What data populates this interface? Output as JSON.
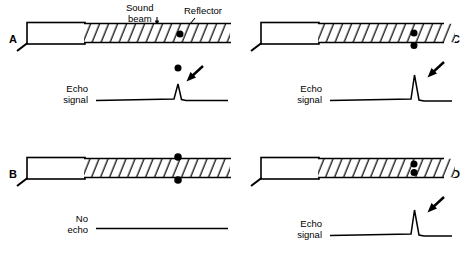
{
  "figure": {
    "width": 469,
    "height": 254,
    "background_color": "#ffffff",
    "ink_color": "#000000"
  },
  "annotations": {
    "sound_beam_line1": "Sound",
    "sound_beam_line2": "beam",
    "reflector": "Reflector"
  },
  "panels": [
    {
      "id": "A",
      "letter": "A",
      "position": "top-left",
      "letter_side": "left",
      "transducer": {
        "name": "transducer-probe",
        "cable": true
      },
      "beam": {
        "name": "sound-beam",
        "hatched": true
      },
      "reflectors": [
        {
          "name": "reflector-dot-in-beam",
          "location": "inside-beam"
        }
      ],
      "signal": {
        "label_line1": "Echo",
        "label_line2": "signal",
        "has_echo": true,
        "spike_height": "small",
        "marker_dot_above_spike": true,
        "arrow": true
      }
    },
    {
      "id": "C",
      "letter": "C",
      "position": "top-right",
      "letter_side": "right",
      "transducer": {
        "name": "transducer-probe",
        "cable": true
      },
      "beam": {
        "name": "sound-beam",
        "hatched": true
      },
      "reflectors": [
        {
          "name": "reflector-dot-in-beam",
          "location": "inside-beam"
        },
        {
          "name": "reflector-dot-at-lower-edge",
          "location": "lower-edge"
        }
      ],
      "signal": {
        "label_line1": "Echo",
        "label_line2": "signal",
        "has_echo": true,
        "spike_height": "large",
        "marker_dot_above_spike": false,
        "arrow": true
      }
    },
    {
      "id": "B",
      "letter": "B",
      "position": "bottom-left",
      "letter_side": "left",
      "transducer": {
        "name": "transducer-probe",
        "cable": true
      },
      "beam": {
        "name": "sound-beam",
        "hatched": true
      },
      "reflectors": [
        {
          "name": "reflector-dot-above-beam",
          "location": "above-beam"
        },
        {
          "name": "reflector-dot-below-beam",
          "location": "below-beam"
        }
      ],
      "signal": {
        "label_line1": "No",
        "label_line2": "echo",
        "has_echo": false,
        "spike_height": "none",
        "marker_dot_above_spike": false,
        "arrow": false
      }
    },
    {
      "id": "D",
      "letter": "D",
      "position": "bottom-right",
      "letter_side": "right",
      "transducer": {
        "name": "transducer-probe",
        "cable": true
      },
      "beam": {
        "name": "sound-beam",
        "hatched": true
      },
      "reflectors": [
        {
          "name": "reflector-dot-upper-in-beam",
          "location": "inside-beam-upper"
        },
        {
          "name": "reflector-dot-lower-in-beam",
          "location": "inside-beam-lower"
        }
      ],
      "signal": {
        "label_line1": "Echo",
        "label_line2": "signal",
        "has_echo": true,
        "spike_height": "large",
        "marker_dot_above_spike": false,
        "arrow": true
      }
    }
  ]
}
